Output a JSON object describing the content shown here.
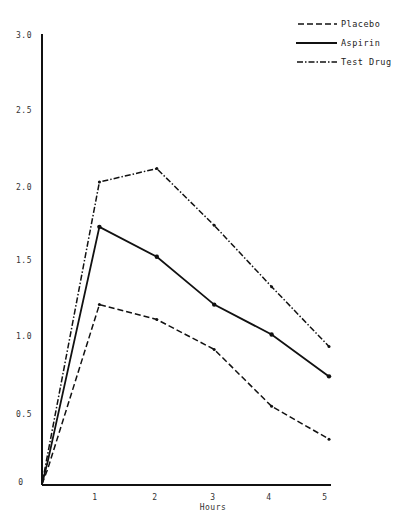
{
  "chart_data": {
    "type": "line",
    "title": "",
    "xlabel": "Hours",
    "ylabel": "",
    "xlim": [
      0,
      5
    ],
    "ylim": [
      0,
      3.0
    ],
    "grid": false,
    "legend_position": "top-right",
    "x_ticks": [
      "1",
      "2",
      "3",
      "4",
      "5"
    ],
    "y_ticks": [
      "0",
      "0.5",
      "1.0",
      "1.5",
      "2.0",
      "2.5",
      "3.0"
    ],
    "x": [
      0,
      0.1,
      1,
      2,
      3,
      4,
      5
    ],
    "series": [
      {
        "name": "Placebo",
        "style": "dashed",
        "values": [
          0,
          0.1,
          1.2,
          1.1,
          0.9,
          0.52,
          0.3
        ]
      },
      {
        "name": "Aspirin",
        "style": "solid",
        "values": [
          0,
          0.15,
          1.72,
          1.52,
          1.2,
          1.0,
          0.72
        ]
      },
      {
        "name": "Test Drug",
        "style": "dash-dot",
        "values": [
          0,
          0.2,
          2.02,
          2.11,
          1.73,
          1.32,
          0.92
        ]
      }
    ]
  },
  "legend": {
    "items": [
      {
        "label": "Placebo"
      },
      {
        "label": "Aspirin"
      },
      {
        "label": "Test Drug"
      }
    ]
  },
  "axes": {
    "x_title": "Hours",
    "y_tick_labels": [
      "3.0",
      "2.5",
      "2.0",
      "1.5",
      "1.0",
      "0.5",
      "0"
    ],
    "x_tick_labels": [
      "1",
      "2",
      "3",
      "4",
      "5"
    ]
  }
}
